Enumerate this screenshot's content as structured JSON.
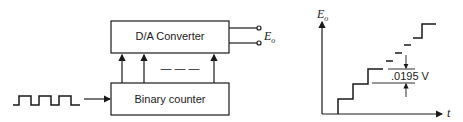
{
  "block_diagram": {
    "dac_label": "D/A Converter",
    "counter_label": "Binary counter",
    "output_label": "E",
    "output_sub": "o",
    "bus_ellipsis": "— — —",
    "input_signal": "square-wave clock pulses"
  },
  "graph": {
    "y_axis_label": "E",
    "y_axis_sub": "o",
    "x_axis_label": "t",
    "step_annotation": ".0195 V",
    "shape": "staircase"
  },
  "colors": {
    "stroke": "#1a1a1a",
    "background": "#ffffff"
  }
}
